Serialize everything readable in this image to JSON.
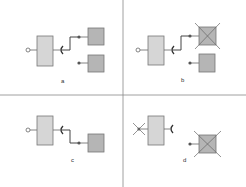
{
  "colors": {
    "component_large": "#d6d6d6",
    "component_small": "#b5b5b5",
    "stroke": "#666666",
    "divider": "#888888",
    "cross": "#666666"
  },
  "panels": [
    {
      "label": "a",
      "description": "Component with provided port connected via required socket to first dependency; second dependency unconnected"
    },
    {
      "label": "b",
      "description": "Same as (a) but the connected dependency is removed (crossed out)"
    },
    {
      "label": "c",
      "description": "Component connected via socket to a single dependency"
    },
    {
      "label": "d",
      "description": "Component's provided port crossed out; dependency crossed out and disconnected"
    }
  ]
}
